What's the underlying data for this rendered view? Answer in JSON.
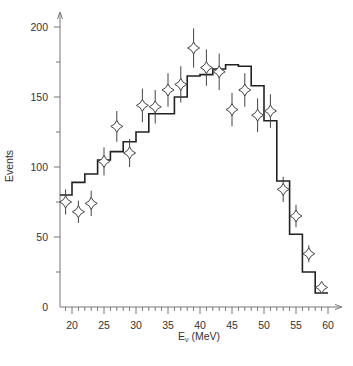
{
  "chart_data": {
    "type": "line",
    "title": "",
    "xlabel": "Eν (MeV)",
    "xlabel_main": "E",
    "xlabel_sub": "ν",
    "xlabel_unit": " (MeV)",
    "ylabel": "Events",
    "xlim": [
      18,
      62
    ],
    "ylim": [
      0,
      210
    ],
    "x_ticks": [
      20,
      25,
      30,
      35,
      40,
      45,
      50,
      55,
      60
    ],
    "x_minor_step": 1,
    "y_ticks": [
      0,
      50,
      100,
      150,
      200
    ],
    "y_minor_ticks": [
      25,
      75,
      125,
      175
    ],
    "grid": false,
    "legend": null,
    "series": [
      {
        "name": "data",
        "kind": "points_with_error_bars",
        "marker": "four-point-star",
        "x": [
          19,
          21,
          23,
          25,
          27,
          29,
          31,
          33,
          35,
          37,
          39,
          41,
          43,
          45,
          47,
          49,
          51,
          53,
          55,
          57,
          59
        ],
        "y": [
          75,
          68,
          74,
          104,
          129,
          110,
          144,
          143,
          155,
          159,
          185,
          171,
          168,
          141,
          155,
          137,
          140,
          84,
          65,
          38,
          14
        ],
        "yerr": [
          9,
          8,
          9,
          10,
          11,
          10,
          12,
          12,
          12,
          13,
          14,
          13,
          13,
          12,
          12,
          12,
          12,
          9,
          8,
          6,
          4
        ]
      },
      {
        "name": "prediction",
        "kind": "step_histogram",
        "bin_edges": [
          18,
          20,
          22,
          24,
          26,
          28,
          30,
          32,
          34,
          36,
          38,
          40,
          42,
          44,
          46,
          48,
          50,
          52,
          54,
          56,
          58,
          60
        ],
        "values": [
          80,
          89,
          95,
          105,
          111,
          118,
          125,
          138,
          138,
          150,
          165,
          166,
          170,
          173,
          172,
          158,
          133,
          90,
          52,
          25,
          10
        ]
      }
    ]
  }
}
